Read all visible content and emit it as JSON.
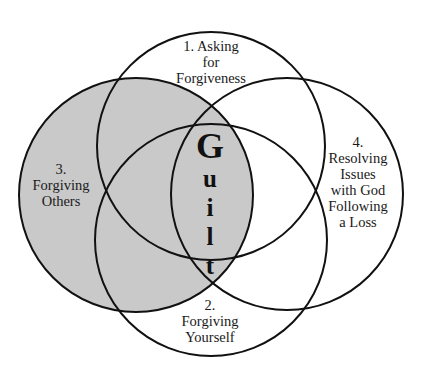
{
  "diagram": {
    "type": "venn",
    "center_label": "Guilt",
    "center_letters": [
      "G",
      "u",
      "i",
      "l",
      "t"
    ],
    "colors": {
      "background": "#ffffff",
      "stroke": "#111111",
      "shaded_fill": "#c9c9c9"
    },
    "circles": [
      {
        "id": "1",
        "lines": [
          "1. Asking",
          "for",
          "Forgiveness"
        ],
        "cx": 211,
        "cy": 146,
        "r": 114,
        "shaded": false
      },
      {
        "id": "2",
        "lines": [
          "2.",
          "Forgiving",
          "Yourself"
        ],
        "cx": 211,
        "cy": 240,
        "r": 116,
        "shaded": false
      },
      {
        "id": "3",
        "lines": [
          "3.",
          "Forgiving",
          "Others"
        ],
        "cx": 136,
        "cy": 195,
        "r": 117,
        "shaded": true
      },
      {
        "id": "4",
        "lines": [
          "4.",
          "Resolving",
          "Issues",
          "with God",
          "Following",
          "a Loss"
        ],
        "cx": 287,
        "cy": 194,
        "r": 116,
        "shaded": false
      }
    ]
  }
}
